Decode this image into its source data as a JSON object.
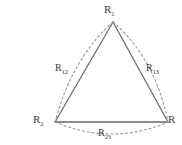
{
  "figure": {
    "kind": "triangle-three-body-distance-diagram",
    "background_color": "#ffffff",
    "solid_edge_color": "#6e6e6e",
    "dashed_arc_color": "#9a9a9a",
    "label_color": "#3a3a3a",
    "vertices": [
      {
        "id": "v1",
        "name": "apex",
        "base": "R",
        "subscript": "1",
        "x": 113,
        "y": 22
      },
      {
        "id": "v2",
        "name": "bottom-left",
        "base": "R",
        "subscript": "2",
        "x": 55,
        "y": 122
      },
      {
        "id": "v3",
        "name": "bottom-right",
        "base": "R",
        "subscript": "",
        "x": 168,
        "y": 122
      }
    ],
    "edges": [
      {
        "id": "e12",
        "name": "left-edge",
        "from": "v1",
        "to": "v2",
        "base": "R",
        "subscript": "12",
        "style": "solid-with-outward-dashed-arc"
      },
      {
        "id": "e13",
        "name": "right-edge",
        "from": "v1",
        "to": "v3",
        "base": "R",
        "subscript": "13",
        "style": "solid-with-outward-dashed-arc"
      },
      {
        "id": "e23",
        "name": "bottom-edge",
        "from": "v2",
        "to": "v3",
        "base": "R",
        "subscript": "23",
        "style": "solid-with-outward-dashed-arc"
      }
    ]
  }
}
